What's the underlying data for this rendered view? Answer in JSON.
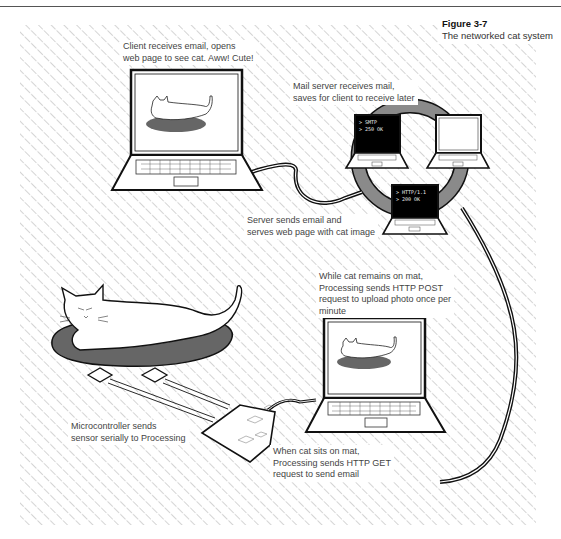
{
  "figure": {
    "number": "Figure 3-7",
    "title": "The networked cat system"
  },
  "labels": {
    "client": [
      "Client receives email, opens",
      "web page to see cat. Aww! Cute!"
    ],
    "mail_server": [
      "Mail server receives mail,",
      "saves for client to receive later"
    ],
    "server": [
      "Server sends email and",
      "serves web page with cat image"
    ],
    "post": [
      "While cat remains on mat,",
      "Processing sends HTTP POST",
      "request to upload photo once per",
      "minute"
    ],
    "get": [
      "When cat sits on mat,",
      "Processing sends HTTP GET",
      "request to send email"
    ],
    "micro": [
      "Microcontroller sends",
      "sensor serially to Processing"
    ]
  },
  "screens": {
    "mail_server": [
      "> SMTP",
      "> 250 OK"
    ],
    "web_server": [
      "> HTTP/1.1",
      "> 200 OK"
    ]
  },
  "colors": {
    "hatch": "#bdbdbd",
    "line": "#111111",
    "ring": "#8a8a8a",
    "mat": "#666666",
    "screen_dark": "#000000"
  }
}
